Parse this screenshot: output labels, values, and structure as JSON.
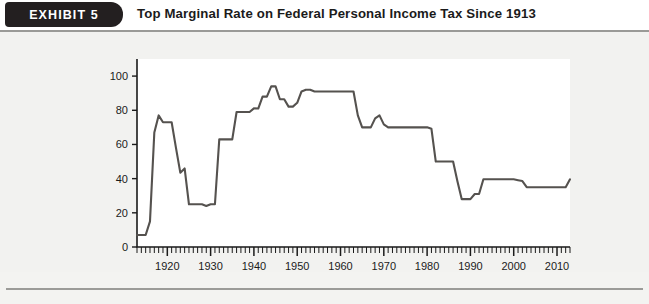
{
  "header": {
    "badge_label": "EXHIBIT  5",
    "title": "Top Marginal Rate on Federal Personal Income Tax Since 1913"
  },
  "colors": {
    "badge_background": "#231f20",
    "badge_text": "#ffffff",
    "page_background": "#f2f2f0",
    "plot_background": "#ffffff",
    "line": "#55524f",
    "axis": "#1b1b1b",
    "rule": "#9a9a97"
  },
  "chart_data": {
    "type": "line",
    "title": "Top Marginal Rate on Federal Personal Income Tax Since 1913",
    "xlabel": "",
    "ylabel": "Marginal tax rate as percent of income",
    "xlim": [
      1913,
      2013
    ],
    "ylim": [
      0,
      110
    ],
    "yticks": [
      0,
      20,
      40,
      60,
      80,
      100
    ],
    "xticks": [
      1920,
      1930,
      1940,
      1950,
      1960,
      1970,
      1980,
      1990,
      2000,
      2010
    ],
    "minor_tick_interval": 1,
    "grid": false,
    "legend": false,
    "series": [
      {
        "name": "Top marginal tax rate",
        "x": [
          1913,
          1914,
          1915,
          1916,
          1917,
          1918,
          1919,
          1920,
          1921,
          1922,
          1923,
          1924,
          1925,
          1926,
          1927,
          1928,
          1929,
          1930,
          1931,
          1932,
          1933,
          1934,
          1935,
          1936,
          1937,
          1938,
          1939,
          1940,
          1941,
          1942,
          1943,
          1944,
          1945,
          1946,
          1947,
          1948,
          1949,
          1950,
          1951,
          1952,
          1953,
          1954,
          1955,
          1956,
          1957,
          1958,
          1959,
          1960,
          1961,
          1962,
          1963,
          1964,
          1965,
          1966,
          1967,
          1968,
          1969,
          1970,
          1971,
          1972,
          1973,
          1974,
          1975,
          1976,
          1977,
          1978,
          1979,
          1980,
          1981,
          1982,
          1983,
          1984,
          1985,
          1986,
          1987,
          1988,
          1989,
          1990,
          1991,
          1992,
          1993,
          1994,
          1995,
          1996,
          1997,
          1998,
          1999,
          2000,
          2001,
          2002,
          2003,
          2004,
          2005,
          2006,
          2007,
          2008,
          2009,
          2010,
          2011,
          2012,
          2013
        ],
        "values": [
          7,
          7,
          7,
          15,
          67,
          77,
          73,
          73,
          73,
          58,
          43.5,
          46,
          25,
          25,
          25,
          25,
          24,
          25,
          25,
          63,
          63,
          63,
          63,
          79,
          79,
          79,
          79,
          81.1,
          81,
          88,
          88,
          94,
          94,
          86.45,
          86.45,
          82.13,
          82.13,
          84.36,
          91,
          92,
          92,
          91,
          91,
          91,
          91,
          91,
          91,
          91,
          91,
          91,
          91,
          77,
          70,
          70,
          70,
          75.25,
          77,
          71.75,
          70,
          70,
          70,
          70,
          70,
          70,
          70,
          70,
          70,
          70,
          69.125,
          50,
          50,
          50,
          50,
          50,
          38.5,
          28,
          28,
          28,
          31,
          31,
          39.6,
          39.6,
          39.6,
          39.6,
          39.6,
          39.6,
          39.6,
          39.6,
          39.1,
          38.6,
          35,
          35,
          35,
          35,
          35,
          35,
          35,
          35,
          35,
          35,
          39.6
        ]
      }
    ]
  }
}
